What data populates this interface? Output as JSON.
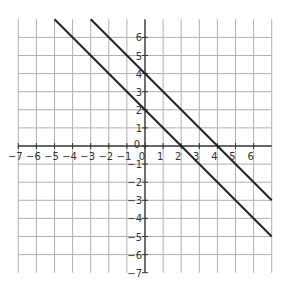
{
  "chart_data": {
    "type": "line",
    "title": "",
    "xlabel": "",
    "ylabel": "",
    "xlim": [
      -7,
      7
    ],
    "ylim": [
      -7,
      7
    ],
    "grid": true,
    "x_ticks": [
      -7,
      -6,
      -5,
      -4,
      -3,
      -2,
      -1,
      0,
      1,
      2,
      3,
      4,
      5,
      6
    ],
    "y_ticks": [
      -7,
      -6,
      -5,
      -4,
      -3,
      -2,
      -1,
      0,
      1,
      2,
      3,
      4,
      5,
      6
    ],
    "series": [
      {
        "name": "y = -x + 2",
        "slope": -1,
        "intercept": 2,
        "x": [
          -5,
          7
        ],
        "y": [
          7,
          -5
        ],
        "color": "#222222"
      },
      {
        "name": "y = -x + 4",
        "slope": -1,
        "intercept": 4,
        "x": [
          -3,
          7
        ],
        "y": [
          7,
          -3
        ],
        "color": "#222222"
      }
    ],
    "legend": null
  },
  "colors": {
    "grid": "#b0b0b0",
    "axis": "#333333",
    "line": "#222222"
  }
}
